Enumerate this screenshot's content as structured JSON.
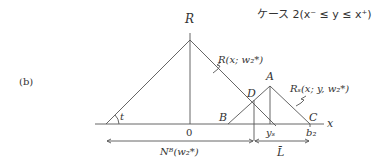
{
  "figure": {
    "panel_label": "(b)",
    "case_title": "ケース 2(x⁻ ≤ y ≤ x⁺)",
    "points": {
      "R": "R",
      "A": "A",
      "B": "B",
      "C": "C",
      "D": "D",
      "origin": "0",
      "t": "t",
      "x_axis": "x",
      "ys": "yₛ",
      "b2": "b₂"
    },
    "curve_labels": {
      "R_curve": "R(x; w₂*)",
      "Rs_curve": "Rₛ(x; y, w₂*)"
    },
    "dimension_labels": {
      "left_span": "Nᴮ(w₂*)",
      "right_span": "L̄"
    }
  }
}
